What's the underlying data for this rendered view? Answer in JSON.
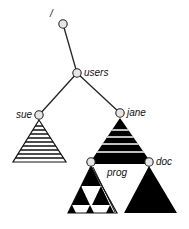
{
  "diagram": {
    "type": "filesystem-tree",
    "root": {
      "label": "/"
    },
    "nodes": [
      {
        "id": "root",
        "label": "/"
      },
      {
        "id": "users",
        "label": "users"
      },
      {
        "id": "sue",
        "label": "sue"
      },
      {
        "id": "jane",
        "label": "jane"
      },
      {
        "id": "prog",
        "label": "prog"
      },
      {
        "id": "doc",
        "label": "doc"
      }
    ],
    "edges": [
      [
        "root",
        "users"
      ],
      [
        "users",
        "sue"
      ],
      [
        "users",
        "jane"
      ],
      [
        "jane",
        "prog"
      ],
      [
        "jane",
        "doc"
      ]
    ],
    "subtrees": [
      {
        "node": "sue",
        "pattern": "horizontal-stripes"
      },
      {
        "node": "jane",
        "pattern": "black-with-white-bands"
      },
      {
        "node": "prog",
        "pattern": "checkerboard-triangles"
      },
      {
        "node": "doc",
        "pattern": "solid-black"
      }
    ],
    "colors": {
      "stroke": "#222222",
      "node_fill": "#e6e6e6",
      "fill_dark": "#000000",
      "background": "#ffffff"
    }
  }
}
